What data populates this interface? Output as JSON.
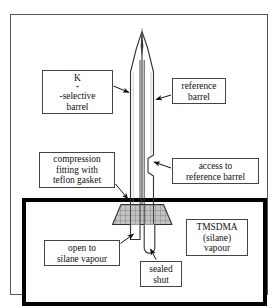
{
  "figure": {
    "colors": {
      "line": "#555555",
      "chamber_border": "#000000",
      "glass_outline": "#333333",
      "gasket_fill": "#b9b9b9",
      "background": "#ffffff"
    }
  },
  "labels": {
    "k_selective_barrel": {
      "line1_prefix": "K",
      "line1_sup": "+",
      "line1_suffix": "-selective",
      "line2": "barrel"
    },
    "reference_barrel": {
      "line1": "reference",
      "line2": "barrel"
    },
    "compression_fitting": {
      "line1": "compression",
      "line2": "fitting with",
      "line3": "teflon gasket"
    },
    "access_to_reference_barrel": {
      "line1": "access to",
      "line2": "reference barrel"
    },
    "open_to_silane_vapour": {
      "line1": "open to",
      "line2": "silane vapour"
    },
    "sealed_shut": {
      "line1": "sealed",
      "line2": "shut"
    },
    "tmsdma_vapour": {
      "line1": "TMSDMA",
      "line2": "(silane)",
      "line3": "vapour"
    }
  },
  "parts": {
    "pipette_tip": "tapered-glass-tip",
    "barrel_septum": "central-dividing-wall",
    "gasket": "cross-hatched-teflon-gasket",
    "left_barrel_end": "open-end",
    "right_barrel_end": "rounded-sealed-end",
    "chamber": "silane-vapour-chamber"
  }
}
